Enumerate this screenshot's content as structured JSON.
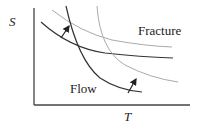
{
  "diagram": {
    "y_axis_label": "S",
    "x_axis_label": "T",
    "labels": {
      "fracture": "Fracture",
      "flow": "Flow"
    },
    "curves": [
      {
        "name": "fracture-initial",
        "style": "solid",
        "color": "#333333"
      },
      {
        "name": "fracture-shifted",
        "style": "gray",
        "color": "#aaaaaa"
      },
      {
        "name": "flow-initial",
        "style": "solid",
        "color": "#333333"
      },
      {
        "name": "flow-shifted",
        "style": "gray",
        "color": "#aaaaaa"
      }
    ],
    "arrows": [
      {
        "name": "fracture-shift-arrow"
      },
      {
        "name": "flow-shift-arrow"
      }
    ]
  }
}
